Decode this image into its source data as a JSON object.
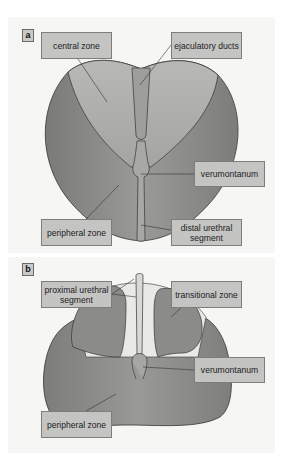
{
  "figure": {
    "panels": [
      {
        "id": "a",
        "tag": "a",
        "title": "Prostate zonal anatomy (coronal view)",
        "labels": {
          "central_zone": "central zone",
          "ejaculatory_ducts": "ejaculatory ducts",
          "verumontanum": "verumontanum",
          "peripheral_zone": "peripheral zone",
          "distal_urethral_segment": "distal urethral segment"
        }
      },
      {
        "id": "b",
        "tag": "b",
        "title": "Prostate zonal anatomy (sagittal/transverse view)",
        "labels": {
          "proximal_urethral_segment": "proximal urethral segment",
          "transitional_zone": "transitional zone",
          "verumontanum": "verumontanum",
          "peripheral_zone": "peripheral zone"
        }
      }
    ],
    "colors": {
      "panel_bg": "#f6f6f4",
      "label_bg": "#c4c4c2",
      "label_border": "#7d7d7b",
      "peripheral_zone": "#8e8e8c",
      "central_zone": "#b3b3b1",
      "transitional_zone": "#8c8c8a",
      "periurethral": "#e8e8e6"
    }
  }
}
